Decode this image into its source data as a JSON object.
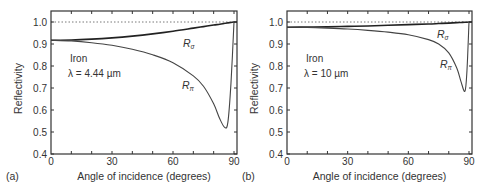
{
  "panels": [
    {
      "panel_label": "(a)",
      "material": "Iron",
      "wavelength": "λ  = 4.44 µm",
      "curve_labels": {
        "sigma": "R",
        "sigma_sub": "σ",
        "pi": "R",
        "pi_sub": "π"
      }
    },
    {
      "panel_label": "(b)",
      "material": "Iron",
      "wavelength": "λ  = 10 µm",
      "curve_labels": {
        "sigma": "R",
        "sigma_sub": "σ",
        "pi": "R",
        "pi_sub": "π"
      }
    }
  ],
  "axes": {
    "xlabel": "Angle of incidence (degrees)",
    "ylabel": "Reflectivity",
    "xticks": [
      "0",
      "30",
      "60",
      "90"
    ],
    "yticks": [
      "0.4",
      "0.5",
      "0.6",
      "0.7",
      "0.8",
      "0.9",
      "1.0"
    ]
  },
  "chart_data": [
    {
      "type": "line",
      "title": "(a) Iron λ = 4.44 µm",
      "xlabel": "Angle of incidence (degrees)",
      "ylabel": "Reflectivity",
      "xlim": [
        0,
        92
      ],
      "ylim": [
        0.4,
        1.05
      ],
      "xticks": [
        0,
        30,
        60,
        90
      ],
      "yticks": [
        0.4,
        0.5,
        0.6,
        0.7,
        0.8,
        0.9,
        1.0
      ],
      "reference_line": {
        "y": 1.0,
        "style": "dotted"
      },
      "x": [
        0,
        10,
        20,
        30,
        40,
        50,
        60,
        70,
        75,
        80,
        83,
        85.5,
        87,
        88.5,
        90
      ],
      "series": [
        {
          "name": "R_σ",
          "values": [
            0.917,
            0.918,
            0.922,
            0.928,
            0.936,
            0.946,
            0.958,
            0.972,
            0.979,
            0.986,
            0.99,
            0.994,
            0.996,
            0.998,
            1.0
          ]
        },
        {
          "name": "R_π",
          "values": [
            0.917,
            0.914,
            0.906,
            0.894,
            0.876,
            0.851,
            0.815,
            0.755,
            0.708,
            0.628,
            0.56,
            0.52,
            0.545,
            0.72,
            1.0
          ]
        }
      ],
      "annotations": [
        "Iron",
        "λ = 4.44 µm",
        "R_σ",
        "R_π",
        "(a)"
      ]
    },
    {
      "type": "line",
      "title": "(b) Iron λ = 10 µm",
      "xlabel": "Angle of incidence (degrees)",
      "ylabel": "Reflectivity",
      "xlim": [
        0,
        92
      ],
      "ylim": [
        0.4,
        1.05
      ],
      "xticks": [
        0,
        30,
        60,
        90
      ],
      "yticks": [
        0.4,
        0.5,
        0.6,
        0.7,
        0.8,
        0.9,
        1.0
      ],
      "reference_line": {
        "y": 1.0,
        "style": "dotted"
      },
      "x": [
        0,
        10,
        20,
        30,
        40,
        50,
        60,
        70,
        75,
        80,
        84,
        86,
        88,
        89,
        90
      ],
      "series": [
        {
          "name": "R_σ",
          "values": [
            0.976,
            0.977,
            0.978,
            0.98,
            0.982,
            0.985,
            0.988,
            0.991,
            0.993,
            0.995,
            0.997,
            0.998,
            0.999,
            0.999,
            1.0
          ]
        },
        {
          "name": "R_π",
          "values": [
            0.976,
            0.975,
            0.972,
            0.968,
            0.962,
            0.954,
            0.942,
            0.92,
            0.9,
            0.86,
            0.79,
            0.73,
            0.685,
            0.78,
            1.0
          ]
        }
      ],
      "annotations": [
        "Iron",
        "λ = 10 µm",
        "R_σ",
        "R_π",
        "(b)"
      ]
    }
  ]
}
